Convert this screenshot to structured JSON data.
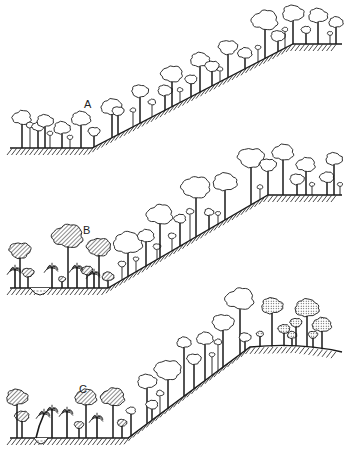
{
  "figure": {
    "panels": [
      {
        "label": "A",
        "label_pos": [
          84,
          98
        ],
        "ground": [
          [
            10,
            148
          ],
          [
            92,
            148
          ],
          [
            293,
            44
          ],
          [
            342,
            44
          ]
        ],
        "hatch_side": "below",
        "valley": null,
        "trees": [
          {
            "x": 22,
            "h": 28,
            "r": 8,
            "type": "open"
          },
          {
            "x": 30,
            "h": 22,
            "r": 4,
            "type": "open-small"
          },
          {
            "x": 38,
            "h": 20,
            "r": 5,
            "type": "open"
          },
          {
            "x": 45,
            "h": 25,
            "r": 7,
            "type": "open"
          },
          {
            "x": 50,
            "h": 14,
            "r": 3,
            "type": "open-small"
          },
          {
            "x": 62,
            "h": 18,
            "r": 7,
            "type": "open"
          },
          {
            "x": 70,
            "h": 10,
            "r": 3,
            "type": "open-small"
          },
          {
            "x": 81,
            "h": 27,
            "r": 8,
            "type": "open"
          },
          {
            "x": 94,
            "h": 14,
            "r": 5,
            "type": "open"
          },
          {
            "x": 112,
            "h": 28,
            "r": 9,
            "type": "open"
          },
          {
            "x": 118,
            "h": 22,
            "r": 5,
            "type": "open"
          },
          {
            "x": 133,
            "h": 16,
            "r": 3,
            "type": "open-small"
          },
          {
            "x": 140,
            "h": 30,
            "r": 7,
            "type": "open"
          },
          {
            "x": 152,
            "h": 14,
            "r": 4,
            "type": "open-small"
          },
          {
            "x": 165,
            "h": 18,
            "r": 6,
            "type": "open"
          },
          {
            "x": 172,
            "h": 30,
            "r": 9,
            "type": "open"
          },
          {
            "x": 180,
            "h": 12,
            "r": 3,
            "type": "open-small"
          },
          {
            "x": 191,
            "h": 16,
            "r": 5,
            "type": "open"
          },
          {
            "x": 200,
            "h": 30,
            "r": 8,
            "type": "open"
          },
          {
            "x": 212,
            "h": 18,
            "r": 6,
            "type": "open"
          },
          {
            "x": 220,
            "h": 12,
            "r": 3,
            "type": "open-small"
          },
          {
            "x": 228,
            "h": 28,
            "r": 8,
            "type": "open"
          },
          {
            "x": 245,
            "h": 14,
            "r": 6,
            "type": "open"
          },
          {
            "x": 258,
            "h": 14,
            "r": 3,
            "type": "open-small"
          },
          {
            "x": 265,
            "h": 35,
            "r": 11,
            "type": "open"
          },
          {
            "x": 278,
            "h": 14,
            "r": 6,
            "type": "open"
          },
          {
            "x": 285,
            "h": 18,
            "r": 3,
            "type": "open-small"
          },
          {
            "x": 293,
            "h": 28,
            "r": 9,
            "type": "open"
          },
          {
            "x": 306,
            "h": 13,
            "r": 4,
            "type": "open"
          },
          {
            "x": 318,
            "h": 26,
            "r": 8,
            "type": "open"
          },
          {
            "x": 330,
            "h": 10,
            "r": 2,
            "type": "open-small"
          },
          {
            "x": 336,
            "h": 20,
            "r": 6,
            "type": "open"
          }
        ]
      },
      {
        "label": "B",
        "label_pos": [
          83,
          224
        ],
        "ground": [
          [
            10,
            288
          ],
          [
            108,
            288
          ],
          [
            268,
            195
          ],
          [
            342,
            195
          ]
        ],
        "hatch_side": "below",
        "valley": {
          "x1": 30,
          "x2": 50,
          "depth": 7
        },
        "trees": [
          {
            "x": 20,
            "h": 35,
            "r": 9,
            "type": "hatched"
          },
          {
            "x": 15,
            "h": 18,
            "r": 6,
            "type": "palm"
          },
          {
            "x": 28,
            "h": 14,
            "r": 5,
            "type": "hatched"
          },
          {
            "x": 52,
            "h": 20,
            "r": 6,
            "type": "palm"
          },
          {
            "x": 62,
            "h": 8,
            "r": 3,
            "type": "hatched"
          },
          {
            "x": 68,
            "h": 48,
            "r": 13,
            "type": "hatched"
          },
          {
            "x": 77,
            "h": 20,
            "r": 6,
            "type": "palm"
          },
          {
            "x": 87,
            "h": 16,
            "r": 5,
            "type": "hatched"
          },
          {
            "x": 94,
            "h": 14,
            "r": 5,
            "type": "palm"
          },
          {
            "x": 99,
            "h": 38,
            "r": 10,
            "type": "hatched"
          },
          {
            "x": 108,
            "h": 10,
            "r": 5,
            "type": "hatched"
          },
          {
            "x": 122,
            "h": 15,
            "r": 4,
            "type": "open-small"
          },
          {
            "x": 128,
            "h": 30,
            "r": 12,
            "type": "open"
          },
          {
            "x": 136,
            "h": 12,
            "r": 3,
            "type": "open-small"
          },
          {
            "x": 146,
            "h": 28,
            "r": 7,
            "type": "open"
          },
          {
            "x": 157,
            "h": 12,
            "r": 4,
            "type": "open-small"
          },
          {
            "x": 160,
            "h": 40,
            "r": 11,
            "type": "open"
          },
          {
            "x": 172,
            "h": 14,
            "r": 4,
            "type": "open-small"
          },
          {
            "x": 180,
            "h": 26,
            "r": 5,
            "type": "open"
          },
          {
            "x": 190,
            "h": 28,
            "r": 4,
            "type": "open-small"
          },
          {
            "x": 196,
            "h": 46,
            "r": 12,
            "type": "open"
          },
          {
            "x": 209,
            "h": 16,
            "r": 4,
            "type": "open"
          },
          {
            "x": 218,
            "h": 10,
            "r": 2,
            "type": "open-small"
          },
          {
            "x": 225,
            "h": 35,
            "r": 10,
            "type": "open"
          },
          {
            "x": 251,
            "h": 44,
            "r": 11,
            "type": "open"
          },
          {
            "x": 260,
            "h": 12,
            "r": 3,
            "type": "open-small"
          },
          {
            "x": 268,
            "h": 28,
            "r": 7,
            "type": "open"
          },
          {
            "x": 283,
            "h": 40,
            "r": 9,
            "type": "open"
          },
          {
            "x": 297,
            "h": 14,
            "r": 6,
            "type": "open"
          },
          {
            "x": 306,
            "h": 28,
            "r": 8,
            "type": "open"
          },
          {
            "x": 312,
            "h": 10,
            "r": 2,
            "type": "open-small"
          },
          {
            "x": 327,
            "h": 16,
            "r": 6,
            "type": "open"
          },
          {
            "x": 334,
            "h": 34,
            "r": 7,
            "type": "open"
          },
          {
            "x": 340,
            "h": 10,
            "r": 2,
            "type": "open-small"
          }
        ]
      },
      {
        "label": "C",
        "label_pos": [
          79,
          383
        ],
        "ground": [
          [
            10,
            438
          ],
          [
            128,
            438
          ],
          [
            250,
            347
          ],
          [
            300,
            346
          ],
          [
            342,
            352
          ]
        ],
        "hatch_side": "below",
        "valley": {
          "x1": 34,
          "x2": 48,
          "depth": 6
        },
        "trees": [
          {
            "x": 17,
            "h": 38,
            "r": 9,
            "type": "hatched"
          },
          {
            "x": 22,
            "h": 20,
            "r": 6,
            "type": "hatched"
          },
          {
            "x": 36,
            "h": 24,
            "r": 6,
            "type": "palm-leaning"
          },
          {
            "x": 52,
            "h": 28,
            "r": 6,
            "type": "palm"
          },
          {
            "x": 67,
            "h": 26,
            "r": 6,
            "type": "palm"
          },
          {
            "x": 79,
            "h": 12,
            "r": 4,
            "type": "hatched"
          },
          {
            "x": 86,
            "h": 38,
            "r": 9,
            "type": "hatched"
          },
          {
            "x": 97,
            "h": 20,
            "r": 6,
            "type": "palm"
          },
          {
            "x": 113,
            "h": 38,
            "r": 10,
            "type": "hatched"
          },
          {
            "x": 122,
            "h": 14,
            "r": 4,
            "type": "hatched"
          },
          {
            "x": 131,
            "h": 24,
            "r": 4,
            "type": "open"
          },
          {
            "x": 147,
            "h": 40,
            "r": 8,
            "type": "open"
          },
          {
            "x": 152,
            "h": 14,
            "r": 5,
            "type": "open"
          },
          {
            "x": 160,
            "h": 20,
            "r": 4,
            "type": "open-small"
          },
          {
            "x": 168,
            "h": 35,
            "r": 11,
            "type": "open"
          },
          {
            "x": 184,
            "h": 52,
            "r": 6,
            "type": "open"
          },
          {
            "x": 194,
            "h": 28,
            "r": 6,
            "type": "open"
          },
          {
            "x": 205,
            "h": 40,
            "r": 7,
            "type": "open"
          },
          {
            "x": 212,
            "h": 20,
            "r": 3,
            "type": "open-small"
          },
          {
            "x": 218,
            "h": 28,
            "r": 4,
            "type": "open-small"
          },
          {
            "x": 223,
            "h": 42,
            "r": 9,
            "type": "open"
          },
          {
            "x": 240,
            "h": 52,
            "r": 12,
            "type": "open"
          },
          {
            "x": 245,
            "h": 12,
            "r": 5,
            "type": "open"
          },
          {
            "x": 260,
            "h": 12,
            "r": 3,
            "type": "dotted"
          },
          {
            "x": 272,
            "h": 38,
            "r": 9,
            "type": "dotted"
          },
          {
            "x": 284,
            "h": 16,
            "r": 5,
            "type": "dotted"
          },
          {
            "x": 292,
            "h": 10,
            "r": 4,
            "type": "dotted"
          },
          {
            "x": 296,
            "h": 22,
            "r": 5,
            "type": "dotted"
          },
          {
            "x": 307,
            "h": 36,
            "r": 10,
            "type": "dotted"
          },
          {
            "x": 313,
            "h": 12,
            "r": 4,
            "type": "dotted"
          },
          {
            "x": 322,
            "h": 22,
            "r": 8,
            "type": "dotted"
          }
        ]
      }
    ]
  },
  "style": {
    "ink": "#1a1a1a",
    "background": "#ffffff"
  }
}
